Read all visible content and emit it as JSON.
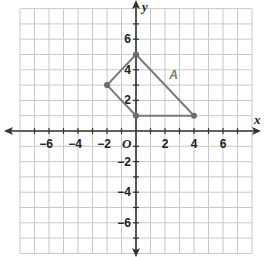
{
  "plane": {
    "x_range": [
      -8,
      8
    ],
    "y_range": [
      -8,
      8
    ],
    "origin_px": [
      136,
      131
    ],
    "unit_x_px": 14.5,
    "unit_y_px": 15.3,
    "grid_color": "#c8c8c8",
    "axis_color": "#333333"
  },
  "axes": {
    "x_label": "x",
    "y_label": "y",
    "origin_label": "O",
    "x_ticks": [
      {
        "value": -6,
        "label": "−6"
      },
      {
        "value": -4,
        "label": "−4"
      },
      {
        "value": -2,
        "label": "−2"
      },
      {
        "value": 2,
        "label": "2"
      },
      {
        "value": 4,
        "label": "4"
      },
      {
        "value": 6,
        "label": "6"
      }
    ],
    "y_ticks": [
      {
        "value": 6,
        "label": "6"
      },
      {
        "value": 4,
        "label": "4"
      },
      {
        "value": 2,
        "label": "2"
      },
      {
        "value": -2,
        "label": "−2"
      },
      {
        "value": -4,
        "label": "−4"
      },
      {
        "value": -6,
        "label": "−6"
      }
    ]
  },
  "figure": {
    "name": "A",
    "color": "#7a7a7a",
    "point_color": "#6a6a6a",
    "vertices": [
      {
        "x": 0,
        "y": 5
      },
      {
        "x": 4,
        "y": 1
      },
      {
        "x": 0,
        "y": 1
      },
      {
        "x": -2,
        "y": 3
      }
    ],
    "label_position": {
      "x": 2.3,
      "y": 3.4
    }
  }
}
